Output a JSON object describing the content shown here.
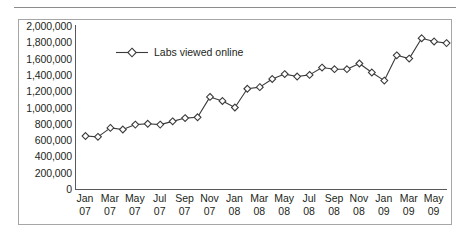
{
  "chart_data": {
    "type": "line",
    "title": "",
    "subtitle": "",
    "xlabel": "",
    "ylabel": "",
    "ylim": [
      0,
      2000000
    ],
    "ytick_values": [
      0,
      200000,
      400000,
      600000,
      800000,
      1000000,
      1200000,
      1400000,
      1600000,
      1800000,
      2000000
    ],
    "ytick_labels": [
      "0",
      "200,000",
      "400,000",
      "600,000",
      "800,000",
      "1,000,000",
      "1,200,000",
      "1,400,000",
      "1,600,000",
      "1,800,000",
      "2,000,000"
    ],
    "xtick_labels": [
      {
        "month": "Jan",
        "year": "07"
      },
      {
        "month": "Mar",
        "year": "07"
      },
      {
        "month": "May",
        "year": "07"
      },
      {
        "month": "Jul",
        "year": "07"
      },
      {
        "month": "Sep",
        "year": "07"
      },
      {
        "month": "Nov",
        "year": "07"
      },
      {
        "month": "Jan",
        "year": "08"
      },
      {
        "month": "Mar",
        "year": "08"
      },
      {
        "month": "May",
        "year": "08"
      },
      {
        "month": "Jul",
        "year": "08"
      },
      {
        "month": "Sep",
        "year": "08"
      },
      {
        "month": "Nov",
        "year": "08"
      },
      {
        "month": "Jan",
        "year": "09"
      },
      {
        "month": "Mar",
        "year": "09"
      },
      {
        "month": "May",
        "year": "09"
      }
    ],
    "grid": false,
    "legend_position": "top-left",
    "x": [
      "Jan 07",
      "Feb 07",
      "Mar 07",
      "Apr 07",
      "May 07",
      "Jun 07",
      "Jul 07",
      "Aug 07",
      "Sep 07",
      "Oct 07",
      "Nov 07",
      "Dec 07",
      "Jan 08",
      "Feb 08",
      "Mar 08",
      "Apr 08",
      "May 08",
      "Jun 08",
      "Jul 08",
      "Aug 08",
      "Sep 08",
      "Oct 08",
      "Nov 08",
      "Dec 08",
      "Jan 09",
      "Feb 09",
      "Mar 09",
      "Apr 09",
      "May 09",
      "Jun 09"
    ],
    "series": [
      {
        "name": "Labs viewed online",
        "marker": "diamond",
        "color": "#3b3b3b",
        "values": [
          650000,
          640000,
          750000,
          730000,
          790000,
          800000,
          790000,
          830000,
          870000,
          880000,
          1130000,
          1080000,
          1000000,
          1230000,
          1250000,
          1350000,
          1410000,
          1380000,
          1400000,
          1490000,
          1470000,
          1470000,
          1540000,
          1430000,
          1330000,
          1640000,
          1600000,
          1850000,
          1810000,
          1790000
        ]
      }
    ]
  },
  "legend": {
    "label": "Labs viewed online"
  }
}
